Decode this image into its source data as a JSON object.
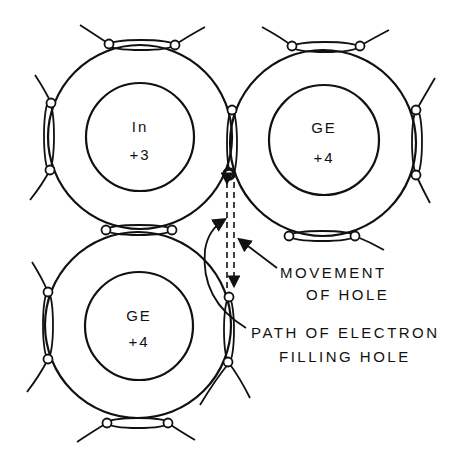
{
  "diagram": {
    "atoms": [
      {
        "symbol": "In",
        "charge": "+3",
        "cx": 140,
        "cy": 137
      },
      {
        "symbol": "GE",
        "charge": "+4",
        "cx": 323,
        "cy": 143
      },
      {
        "symbol": "GE",
        "charge": "+4",
        "cx": 138,
        "cy": 325
      }
    ],
    "annotations": {
      "movement_line1": "MOVEMENT",
      "movement_line2": "OF HOLE",
      "path_line1": "PATH OF ELECTRON",
      "path_line2": "FILLING HOLE"
    },
    "colors": {
      "ink": "#111111",
      "background": "#ffffff"
    }
  }
}
